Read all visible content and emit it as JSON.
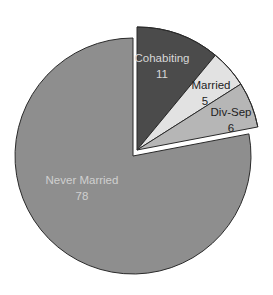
{
  "chart_data": {
    "type": "pie",
    "title": "",
    "start": "top",
    "direction": "clockwise",
    "slices": [
      {
        "label": "Cohabiting",
        "value": 11,
        "value_label": "11",
        "color": "#4b4b4b",
        "text_color": "#d8d8d8",
        "exploded": true
      },
      {
        "label": "Married",
        "value": 5,
        "value_label": "5",
        "color": "#e2e2e2",
        "text_color": "#222222",
        "exploded": true
      },
      {
        "label": "Div-Sep",
        "value": 6,
        "value_label": "6",
        "color": "#b6b6b6",
        "text_color": "#222222",
        "exploded": true
      },
      {
        "label": "Never Married",
        "value": 78,
        "value_label": "78",
        "color": "#8e8e8e",
        "text_color": "#d0d0d0",
        "exploded": false
      }
    ]
  }
}
